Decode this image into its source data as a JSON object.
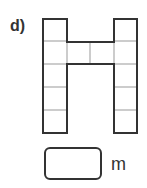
{
  "question": {
    "label": "d)",
    "unit": "m",
    "answer_value": ""
  },
  "shape": {
    "description": "H-shaped figure made of unit squares",
    "left_column_squares": 5,
    "right_column_squares": 5,
    "bridge_squares": 2,
    "bridge_row": 2,
    "total_squares": 12,
    "line_color": "#333333",
    "grid_color": "#999999"
  }
}
